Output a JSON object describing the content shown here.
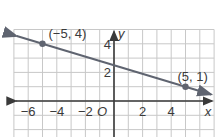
{
  "chart_data": {
    "type": "line",
    "title": "",
    "xlabel": "x",
    "ylabel": "y",
    "origin_label": "O",
    "xlim": [
      -7,
      7
    ],
    "ylim": [
      -3,
      5
    ],
    "grid": true,
    "x_ticks": [
      -6,
      -4,
      -2,
      2,
      4
    ],
    "y_ticks": [
      2,
      4
    ],
    "x_tick_labels": [
      "−6",
      "−4",
      "−2",
      "2",
      "4"
    ],
    "y_tick_labels": [
      "2",
      "4"
    ],
    "series": [
      {
        "name": "line",
        "points": [
          {
            "x": -5,
            "y": 4,
            "label": "(−5, 4)"
          },
          {
            "x": 5,
            "y": 1,
            "label": "(5, 1)"
          }
        ],
        "slope": -0.3,
        "intercept": 2.5,
        "arrows_both_ends": true
      }
    ],
    "colors": {
      "line": "#5f6470",
      "grid": "#c8c8c8",
      "axis": "#3a3a3a",
      "point": "#5f6470"
    }
  }
}
